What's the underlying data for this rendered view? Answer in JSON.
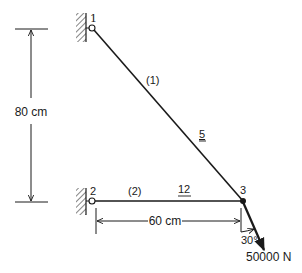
{
  "diagram": {
    "type": "truss",
    "nodes": [
      {
        "id": "1",
        "label": "1",
        "support": "pin-wall",
        "x": 92,
        "y": 28
      },
      {
        "id": "2",
        "label": "2",
        "support": "pin-wall",
        "x": 92,
        "y": 201
      },
      {
        "id": "3",
        "label": "3",
        "support": "none",
        "x": 243,
        "y": 201
      }
    ],
    "elements": [
      {
        "id": "1",
        "label": "(1)",
        "from": "1",
        "to": "3",
        "property": "5"
      },
      {
        "id": "2",
        "label": "(2)",
        "from": "2",
        "to": "3",
        "property": "12"
      }
    ],
    "dimensions": {
      "vertical": {
        "label": "80 cm"
      },
      "horizontal": {
        "label": "60 cm"
      }
    },
    "load": {
      "node": "3",
      "magnitude_label": "50000 N",
      "angle_label": "30°"
    },
    "colors": {
      "line": "#1a1a1a",
      "hatch": "#333333",
      "background": "#ffffff"
    }
  }
}
